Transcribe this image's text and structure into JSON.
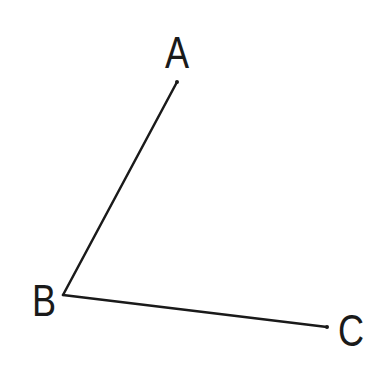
{
  "diagram": {
    "type": "angle",
    "stroke_color": "#1a1a1a",
    "background": "#ffffff",
    "points": [
      {
        "id": "A",
        "label": "A",
        "x": 177,
        "y": 82,
        "label_x": 177,
        "label_y": 68
      },
      {
        "id": "B",
        "label": "B",
        "x": 63,
        "y": 295,
        "label_x": 44,
        "label_y": 316
      },
      {
        "id": "C",
        "label": "C",
        "x": 327,
        "y": 327,
        "label_x": 351,
        "label_y": 346
      }
    ],
    "segments": [
      {
        "from": "B",
        "to": "A"
      },
      {
        "from": "B",
        "to": "C"
      }
    ]
  }
}
